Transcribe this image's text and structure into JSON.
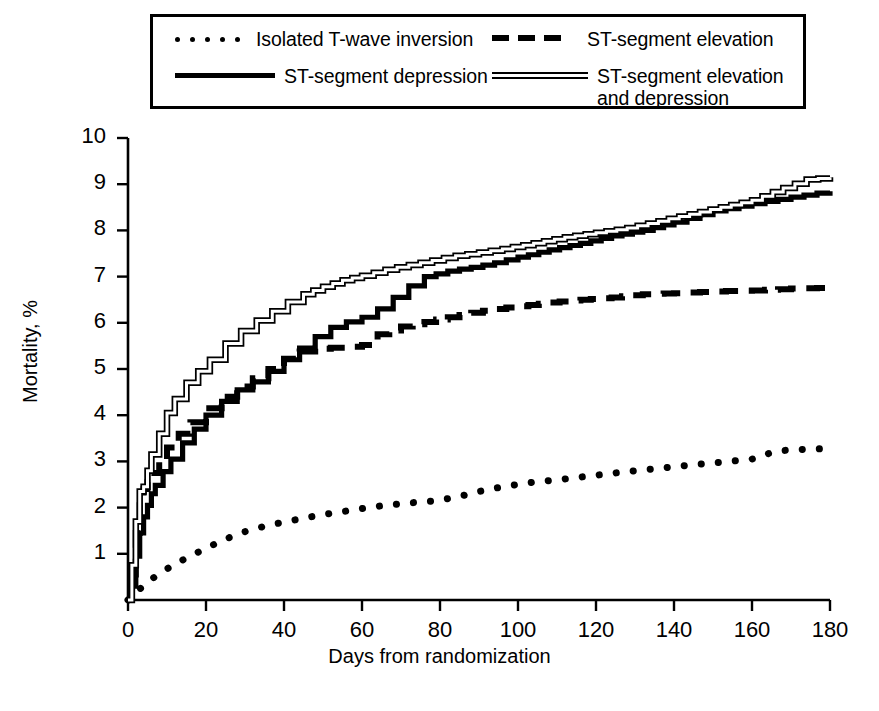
{
  "chart_data": {
    "type": "line",
    "title": "",
    "xlabel": "Days from randomization",
    "ylabel": "Mortality, %",
    "xlim": [
      0,
      180
    ],
    "ylim": [
      0,
      10
    ],
    "xticks": [
      0,
      20,
      40,
      60,
      80,
      100,
      120,
      140,
      160,
      180
    ],
    "yticks": [
      1,
      2,
      3,
      4,
      5,
      6,
      7,
      8,
      9,
      10
    ],
    "grid": false,
    "legend_position": "top",
    "series": [
      {
        "name": "Isolated T-wave inversion",
        "style": "dotted",
        "x": [
          0,
          2,
          4,
          6,
          9,
          12,
          16,
          20,
          25,
          30,
          36,
          42,
          48,
          54,
          60,
          66,
          72,
          78,
          84,
          90,
          96,
          104,
          112,
          120,
          128,
          136,
          144,
          152,
          160,
          166,
          170,
          180
        ],
        "values": [
          0,
          0.18,
          0.3,
          0.45,
          0.62,
          0.78,
          0.95,
          1.12,
          1.32,
          1.48,
          1.62,
          1.72,
          1.82,
          1.9,
          1.98,
          2.05,
          2.1,
          2.14,
          2.22,
          2.35,
          2.45,
          2.55,
          2.62,
          2.7,
          2.78,
          2.85,
          2.92,
          2.98,
          3.05,
          3.22,
          3.25,
          3.28
        ]
      },
      {
        "name": "ST-segment elevation",
        "style": "dashed",
        "x": [
          0,
          1,
          2,
          3,
          4,
          5,
          6,
          8,
          10,
          13,
          16,
          20,
          24,
          28,
          32,
          36,
          40,
          44,
          48,
          52,
          56,
          60,
          64,
          70,
          76,
          82,
          88,
          94,
          100,
          108,
          116,
          124,
          132,
          140,
          150,
          160,
          170,
          180
        ],
        "values": [
          0,
          0.55,
          1.45,
          2.05,
          2.4,
          2.55,
          2.75,
          3.05,
          3.3,
          3.6,
          3.85,
          4.15,
          4.4,
          4.62,
          4.8,
          5.0,
          5.22,
          5.38,
          5.44,
          5.46,
          5.48,
          5.52,
          5.75,
          5.92,
          6.02,
          6.12,
          6.22,
          6.3,
          6.36,
          6.44,
          6.5,
          6.55,
          6.62,
          6.64,
          6.68,
          6.7,
          6.74,
          6.76
        ]
      },
      {
        "name": "ST-segment depression",
        "style": "solid",
        "x": [
          0,
          1,
          2,
          3,
          4,
          5,
          6,
          7,
          9,
          11,
          14,
          17,
          20,
          24,
          28,
          32,
          36,
          40,
          44,
          48,
          52,
          56,
          60,
          64,
          68,
          72,
          76,
          82,
          88,
          94,
          100,
          108,
          116,
          124,
          132,
          140,
          150,
          160,
          170,
          180
        ],
        "values": [
          0,
          0.3,
          0.95,
          1.45,
          1.8,
          2.05,
          2.3,
          2.48,
          2.78,
          3.05,
          3.4,
          3.7,
          4.0,
          4.3,
          4.55,
          4.72,
          4.95,
          5.2,
          5.45,
          5.7,
          5.9,
          6.02,
          6.12,
          6.3,
          6.55,
          6.8,
          7.0,
          7.12,
          7.2,
          7.3,
          7.42,
          7.58,
          7.72,
          7.88,
          8.0,
          8.18,
          8.42,
          8.58,
          8.72,
          8.85
        ]
      },
      {
        "name": "ST-segment elevation and depression",
        "style": "double",
        "x": [
          0,
          1,
          2,
          3,
          4,
          5,
          6,
          8,
          10,
          12,
          15,
          18,
          21,
          25,
          29,
          33,
          37,
          41,
          45,
          50,
          55,
          60,
          66,
          72,
          78,
          84,
          90,
          96,
          104,
          112,
          120,
          128,
          136,
          144,
          152,
          160,
          168,
          174,
          180
        ],
        "values": [
          0,
          0.75,
          1.7,
          2.35,
          2.45,
          2.8,
          3.15,
          3.6,
          4.05,
          4.35,
          4.7,
          4.95,
          5.2,
          5.55,
          5.82,
          6.05,
          6.25,
          6.45,
          6.62,
          6.78,
          6.92,
          7.02,
          7.15,
          7.25,
          7.35,
          7.45,
          7.52,
          7.6,
          7.72,
          7.85,
          7.95,
          8.05,
          8.2,
          8.35,
          8.5,
          8.65,
          8.92,
          9.1,
          9.15
        ]
      }
    ]
  },
  "legend": {
    "items": [
      {
        "label": "Isolated T-wave inversion",
        "style": "dotted"
      },
      {
        "label": "ST-segment elevation",
        "style": "dashed"
      },
      {
        "label": "ST-segment depression",
        "style": "solid"
      },
      {
        "label": "ST-segment elevation\nand depression",
        "style": "double"
      }
    ]
  },
  "colors": {
    "line": "#000000",
    "axis": "#000000",
    "background": "#ffffff"
  }
}
